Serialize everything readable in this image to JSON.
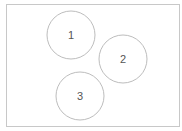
{
  "diagram": {
    "frame": {
      "x": 6.5,
      "y": 4.5,
      "width": 173,
      "height": 122,
      "stroke": "#c8c8c8"
    },
    "nodes": [
      {
        "id": "1",
        "label": "1",
        "cx": 71,
        "cy": 35,
        "r": 24
      },
      {
        "id": "2",
        "label": "2",
        "cx": 123,
        "cy": 59,
        "r": 24
      },
      {
        "id": "3",
        "label": "3",
        "cx": 80,
        "cy": 96,
        "r": 24
      }
    ],
    "colors": {
      "stroke": "#bdbdbd",
      "text": "#555555",
      "background": "#ffffff"
    }
  }
}
